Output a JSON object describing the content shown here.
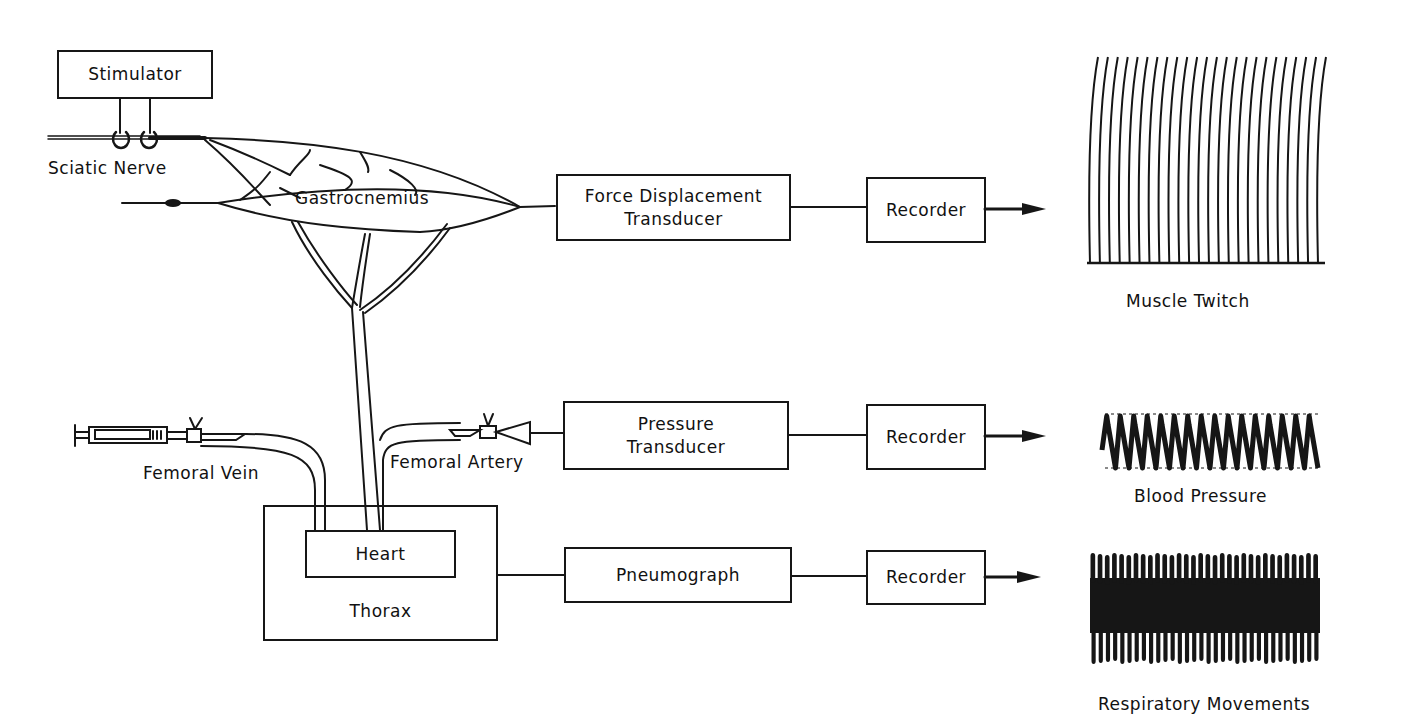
{
  "diagram": {
    "boxes": {
      "stimulator": "Stimulator",
      "force_transducer": {
        "line1": "Force Displacement",
        "line2": "Transducer"
      },
      "pressure_transducer": {
        "line1": "Pressure",
        "line2": "Transducer"
      },
      "pneumograph": "Pneumograph",
      "recorder_1": "Recorder",
      "recorder_2": "Recorder",
      "recorder_3": "Recorder",
      "heart": "Heart",
      "thorax": "Thorax"
    },
    "labels": {
      "sciatic_nerve": "Sciatic Nerve",
      "gastrocnemius": "Gastrocnemius",
      "femoral_vein": "Femoral Vein",
      "femoral_artery": "Femoral Artery"
    },
    "outputs": {
      "muscle_twitch": "Muscle Twitch",
      "blood_pressure": "Blood Pressure",
      "respiratory_movements": "Respiratory Movements"
    },
    "trace_counts": {
      "muscle_twitch_lines": 24,
      "blood_pressure_cycles": 16,
      "respiratory_cycles": 32
    },
    "colors": {
      "ink": "#161616",
      "background": "#ffffff"
    }
  }
}
